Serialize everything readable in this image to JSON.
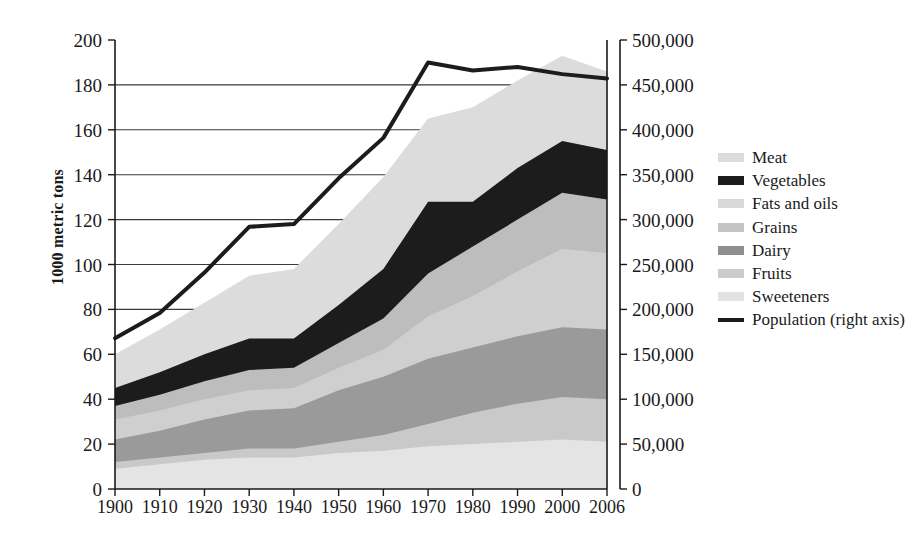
{
  "chart_data": {
    "type": "area",
    "title": "",
    "subtitle": "",
    "xlabel": "",
    "ylabel": "1000 metric tons",
    "ylabel_right": "",
    "x": [
      1900,
      1910,
      1920,
      1930,
      1940,
      1950,
      1960,
      1970,
      1980,
      1990,
      2000,
      2006
    ],
    "xtick_labels": [
      "1900",
      "1910",
      "1920",
      "1930",
      "1940",
      "1950",
      "1960",
      "1970",
      "1980",
      "1990",
      "2000",
      "2006"
    ],
    "ylim": [
      0,
      200
    ],
    "ytick_values": [
      0,
      20,
      40,
      60,
      80,
      100,
      120,
      140,
      160,
      180,
      200
    ],
    "ytick_labels": [
      "0",
      "20",
      "40",
      "60",
      "80",
      "100",
      "120",
      "140",
      "160",
      "180",
      "200"
    ],
    "ylim_right": [
      0,
      500000
    ],
    "ytick_values_right": [
      0,
      50000,
      100000,
      150000,
      200000,
      250000,
      300000,
      350000,
      400000,
      450000,
      500000
    ],
    "ytick_labels_right": [
      "0",
      "50,000",
      "100,000",
      "150,000",
      "200,000",
      "250,000",
      "300,000",
      "350,000",
      "400,000",
      "450,000",
      "500,000"
    ],
    "grid": true,
    "legend_position": "right",
    "stack_order_bottom_to_top": [
      "Sweeteners",
      "Fruits",
      "Dairy",
      "Grains",
      "Fats and oils",
      "Vegetables",
      "Meat"
    ],
    "series": [
      {
        "name": "Sweeteners",
        "color": "#e4e4e4",
        "values": [
          9,
          11,
          13,
          14,
          14,
          16,
          17,
          19,
          20,
          21,
          22,
          21
        ]
      },
      {
        "name": "Fruits",
        "color": "#c9c9c9",
        "values": [
          12,
          14,
          16,
          18,
          18,
          21,
          24,
          29,
          34,
          38,
          41,
          40
        ]
      },
      {
        "name": "Dairy",
        "color": "#9a9a9a",
        "values": [
          22,
          26,
          31,
          35,
          36,
          44,
          50,
          58,
          63,
          68,
          72,
          71
        ]
      },
      {
        "name": "Grains",
        "color": "#cfcfcf",
        "values": [
          31,
          35,
          40,
          44,
          45,
          54,
          62,
          77,
          86,
          97,
          107,
          105
        ]
      },
      {
        "name": "Fats and oils",
        "color": "#bdbdbd",
        "values": [
          37,
          42,
          48,
          53,
          54,
          65,
          76,
          96,
          108,
          120,
          132,
          129
        ]
      },
      {
        "name": "Vegetables",
        "color": "#1c1c1c",
        "values": [
          45,
          52,
          60,
          67,
          67,
          82,
          98,
          128,
          128,
          143,
          155,
          151
        ]
      },
      {
        "name": "Meat",
        "color": "#dcdcdc",
        "values": [
          60,
          71,
          83,
          95,
          98,
          118,
          139,
          165,
          170,
          182,
          193,
          186
        ]
      }
    ],
    "line_series": {
      "name": "Population (right axis)",
      "color": "#1c1c1c",
      "axis": "right",
      "values": [
        168000,
        196000,
        241000,
        292000,
        295000,
        346000,
        391000,
        475000,
        466000,
        470000,
        462000,
        457000
      ]
    }
  },
  "legend": {
    "items": [
      {
        "label": "Meat",
        "swatch": "#dcdcdc",
        "type": "area"
      },
      {
        "label": "Vegetables",
        "swatch": "#1c1c1c",
        "type": "area"
      },
      {
        "label": "Fats and oils",
        "swatch": "#d8d8d8",
        "type": "area"
      },
      {
        "label": "Grains",
        "swatch": "#c4c4c4",
        "type": "area"
      },
      {
        "label": "Dairy",
        "swatch": "#8f8f8f",
        "type": "area"
      },
      {
        "label": "Fruits",
        "swatch": "#cccccc",
        "type": "area"
      },
      {
        "label": "Sweeteners",
        "swatch": "#e2e2e2",
        "type": "area"
      },
      {
        "label": "Population (right axis)",
        "swatch": "#1c1c1c",
        "type": "line"
      }
    ]
  },
  "colors": {
    "axis": "#1a1a1a",
    "grid": "#3a3a3a",
    "background": "#ffffff",
    "line": "#1c1c1c"
  }
}
